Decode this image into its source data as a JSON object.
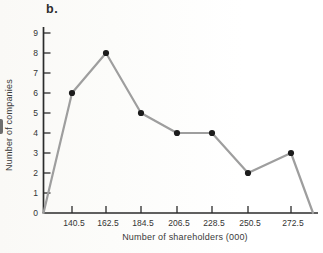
{
  "figure_label": "b.",
  "chart_data": {
    "type": "line",
    "title": "",
    "categories": [
      "140.5",
      "162.5",
      "184.5",
      "206.5",
      "228.5",
      "250.5",
      "272.5"
    ],
    "values": [
      6,
      8,
      5,
      4,
      4,
      2,
      3
    ],
    "closes_to_zero_at_ends": true,
    "xlabel": "Number of shareholders (000)",
    "ylabel": "Number of companies",
    "ylim": [
      0,
      9
    ],
    "y_ticks": [
      0,
      1,
      2,
      3,
      4,
      5,
      6,
      7,
      8,
      9
    ],
    "grid": false,
    "legend": "none",
    "marker": "filled-circle",
    "colors": {
      "line": "#9e9e9e",
      "marker": "#1c1c1c",
      "axis": "#2b2b2b",
      "tick": "#2b2b2b",
      "text": "#333333"
    }
  }
}
